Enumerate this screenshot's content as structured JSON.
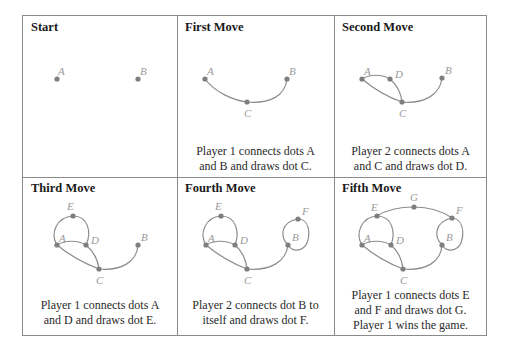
{
  "panels": [
    {
      "title": "Start",
      "caption_lines": []
    },
    {
      "title": "First Move",
      "caption_lines": [
        "Player 1 connects dots A",
        "and B and draws dot C."
      ]
    },
    {
      "title": "Second Move",
      "caption_lines": [
        "Player 2 connects dots A",
        "and C and draws dot D."
      ]
    },
    {
      "title": "Third Move",
      "caption_lines": [
        "Player 1 connects dots A",
        "and D and draws dot E."
      ]
    },
    {
      "title": "Fourth Move",
      "caption_lines": [
        "Player 2 connects dot B to",
        "itself and draws dot F."
      ]
    },
    {
      "title": "Fifth Move",
      "caption_lines": [
        "Player 1 connects dots E",
        "and F and draws dot G.",
        "Player 1 wins the game."
      ]
    }
  ],
  "dot_labels": [
    "A",
    "B",
    "C",
    "D",
    "E",
    "F",
    "G"
  ],
  "colors": {
    "border": "#8a8a8a",
    "edge": "#8c8c8c",
    "dot": "#7e7e7e",
    "label": "#9a9a9a",
    "text": "#1a1a1a"
  }
}
